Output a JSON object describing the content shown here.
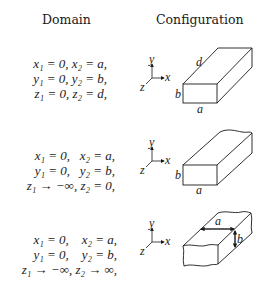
{
  "headers": {
    "domain": "Domain",
    "configuration": "Configuration"
  },
  "rows": [
    {
      "domain_lines": [
        "x₁ = 0, x₂ = a,",
        "y₁ = 0, y₂ = b,",
        "z₁ = 0, z₂ = d,"
      ],
      "configuration": "finite box",
      "labels": {
        "a": "a",
        "b": "b",
        "d": "d"
      }
    },
    {
      "domain_lines": [
        "x₁ = 0,   x₂ = a,",
        "y₁ = 0,   y₂ = b,",
        "z₁ → −∞, z₂ = 0,"
      ],
      "configuration": "semi-infinite box",
      "labels": {
        "a": "a",
        "b": "b"
      }
    },
    {
      "domain_lines": [
        "x₁ = 0,    x₂ = a,",
        "y₁ = 0,    y₂ = b,",
        "z₁ → −∞, z₂ → ∞,"
      ],
      "configuration": "infinite duct",
      "labels": {
        "a": "a",
        "b": "b"
      }
    }
  ],
  "axes": {
    "x": "x",
    "y": "y",
    "z": "z"
  }
}
